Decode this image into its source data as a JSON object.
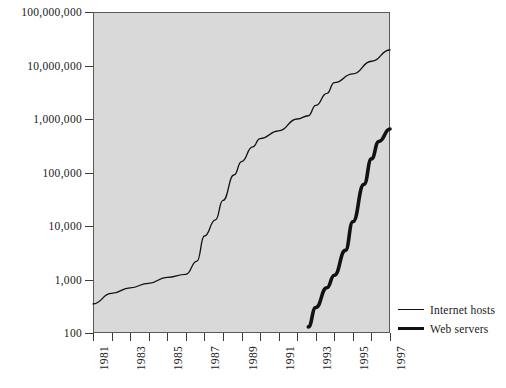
{
  "chart_data": {
    "type": "line",
    "title": "",
    "subtitle": "",
    "xlabel": "",
    "ylabel": "",
    "yscale": "log",
    "ylim": [
      100,
      100000000
    ],
    "xlim": [
      1981,
      1997
    ],
    "grid": false,
    "legend_position": "right-bottom-outside",
    "y_tick_labels": [
      "100,000,000",
      "10,000,000",
      "1,000,000",
      "100,000",
      "10,000",
      "1,000",
      "100"
    ],
    "y_tick_values": [
      100000000,
      10000000,
      1000000,
      100000,
      10000,
      1000,
      100
    ],
    "x_tick_labels": [
      "1981",
      "1983",
      "1985",
      "1987",
      "1989",
      "1991",
      "1993",
      "1995",
      "1997"
    ],
    "x_tick_values": [
      1981,
      1983,
      1985,
      1987,
      1989,
      1991,
      1993,
      1995,
      1997
    ],
    "x_minor_tick_values": [
      1982,
      1984,
      1986,
      1988,
      1990,
      1992,
      1994,
      1996
    ],
    "series": [
      {
        "name": "Internet hosts",
        "style": "thin",
        "x": [
          1981.0,
          1982.0,
          1983.0,
          1984.0,
          1985.0,
          1986.0,
          1986.6,
          1987.0,
          1987.6,
          1988.0,
          1988.6,
          1989.0,
          1989.6,
          1990.0,
          1991.0,
          1992.0,
          1992.6,
          1993.0,
          1993.6,
          1994.0,
          1995.0,
          1996.0,
          1997.0
        ],
        "y": [
          350,
          550,
          700,
          850,
          1100,
          1250,
          2200,
          6500,
          13000,
          30000,
          90000,
          160000,
          300000,
          430000,
          600000,
          1000000,
          1150000,
          1800000,
          3000000,
          4800000,
          7000000,
          12000000,
          19500000
        ]
      },
      {
        "name": "Web servers",
        "style": "thick",
        "x": [
          1992.6,
          1993.0,
          1993.6,
          1994.0,
          1994.6,
          1995.0,
          1995.6,
          1996.0,
          1996.4,
          1997.0
        ],
        "y": [
          130,
          300,
          700,
          1200,
          3500,
          12000,
          60000,
          180000,
          380000,
          650000
        ]
      }
    ]
  },
  "legend": {
    "items": [
      {
        "label": "Internet hosts",
        "style": "thin"
      },
      {
        "label": "Web servers",
        "style": "thick"
      }
    ]
  },
  "colors": {
    "plot_background": "#d9d9d9",
    "page_background": "#ffffff",
    "line": "#111111",
    "axis": "#5a5a5a",
    "text": "#1a1a1a"
  }
}
